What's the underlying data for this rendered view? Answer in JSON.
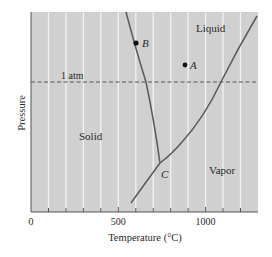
{
  "figure": {
    "title": "",
    "xlabel": "Temperature (°C)",
    "ylabel": "Pressure",
    "x_ticks": [
      {
        "value": 0,
        "label": "0"
      },
      {
        "value": 500,
        "label": "500"
      },
      {
        "value": 1000,
        "label": "1000"
      }
    ],
    "x_minor_ticks": [
      100,
      200,
      300,
      400,
      600,
      700,
      800,
      900,
      1100,
      1200
    ],
    "xlim": [
      0,
      1300
    ],
    "reference_line": {
      "label": "1 atm",
      "style": "dashed"
    },
    "regions": [
      {
        "name": "solid",
        "label": "Solid"
      },
      {
        "name": "liquid",
        "label": "Liquid"
      },
      {
        "name": "vapor",
        "label": "Vapor"
      }
    ],
    "points": [
      {
        "name": "point-a",
        "label": "A"
      },
      {
        "name": "point-b",
        "label": "B"
      },
      {
        "name": "point-c",
        "label": "C"
      }
    ],
    "curves": [
      {
        "name": "melting-curve",
        "label": "Solid–Liquid boundary"
      },
      {
        "name": "vaporization-curve",
        "label": "Liquid–Vapor boundary"
      },
      {
        "name": "sublimation-curve",
        "label": "Solid–Vapor boundary"
      }
    ],
    "colors": {
      "plot_background": "#d0d0d0",
      "gridline": "#f2f2f2",
      "curve": "#5a5a5a",
      "axis": "#555555",
      "text": "#2a2a2a"
    }
  }
}
